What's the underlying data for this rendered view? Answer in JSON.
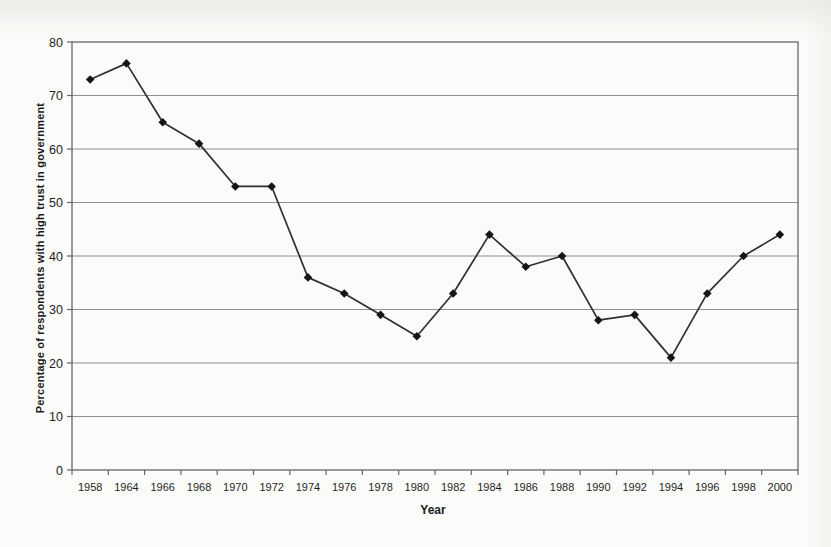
{
  "page": {
    "background": "#fbfbf9"
  },
  "chart_data": {
    "type": "line",
    "title": "",
    "xlabel": "Year",
    "ylabel": "Percentage of respondents with high trust in government",
    "categories": [
      "1958",
      "1964",
      "1966",
      "1968",
      "1970",
      "1972",
      "1974",
      "1976",
      "1978",
      "1980",
      "1982",
      "1984",
      "1986",
      "1988",
      "1990",
      "1992",
      "1994",
      "1996",
      "1998",
      "2000"
    ],
    "values": [
      73,
      76,
      65,
      61,
      53,
      53,
      36,
      33,
      29,
      25,
      33,
      44,
      38,
      40,
      28,
      29,
      21,
      33,
      40,
      44
    ],
    "ylim": [
      0,
      80
    ],
    "ytick_step": 10,
    "yticks": [
      "0",
      "10",
      "20",
      "30",
      "40",
      "50",
      "60",
      "70",
      "80"
    ],
    "grid": "horizontal",
    "legend": "none",
    "marker": "diamond",
    "colors": {
      "line": "#303030",
      "marker": "#161616",
      "gridline": "#8f8f8f",
      "frame": "#666666",
      "tick_text": "#1f1f1f",
      "axis_title_text": "#1a1a1a"
    }
  }
}
